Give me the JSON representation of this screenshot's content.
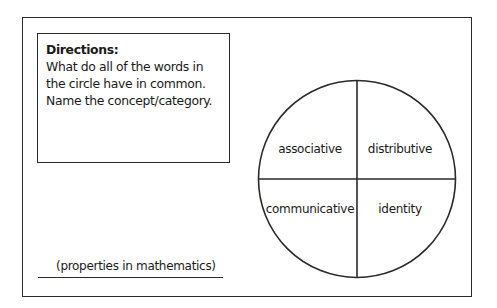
{
  "directions": {
    "title": "Directions:",
    "text": "What do all of the words in the circle have in common. Name the concept/category."
  },
  "circle": {
    "quadrants": [
      {
        "position": "top-left",
        "label": "associative"
      },
      {
        "position": "top-right",
        "label": "distributive"
      },
      {
        "position": "bottom-left",
        "label": "communicative"
      },
      {
        "position": "bottom-right",
        "label": "identity"
      }
    ]
  },
  "answer": {
    "text": "(properties in mathematics)"
  },
  "colors": {
    "line": "#2a2a2a",
    "text": "#1a1a1a",
    "background": "#ffffff"
  }
}
